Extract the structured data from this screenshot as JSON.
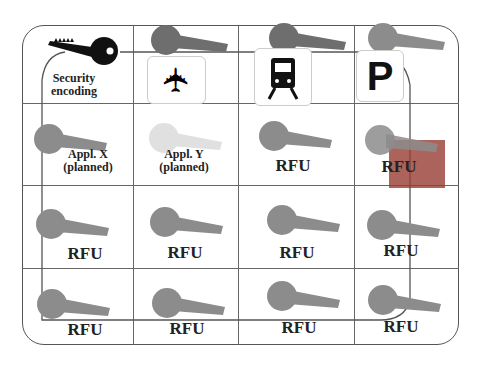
{
  "diagram": {
    "title_cell": {
      "label_line1": "Security",
      "label_line2": "encoding",
      "key_color": "#111111"
    },
    "icons": [
      {
        "name": "airplane-icon",
        "glyph": "✈"
      },
      {
        "name": "train-icon",
        "glyph": "🚆"
      },
      {
        "name": "parking-icon",
        "glyph": "P"
      }
    ],
    "cells": [
      {
        "line1": "Appl. X",
        "line2": "(planned)"
      },
      {
        "line1": "Appl. Y",
        "line2": "(planned)"
      },
      {
        "label": "RFU"
      },
      {
        "label": "RFU"
      },
      {
        "label": "RFU"
      },
      {
        "label": "RFU"
      },
      {
        "label": "RFU"
      },
      {
        "label": "RFU"
      },
      {
        "label": "RFU"
      },
      {
        "label": "RFU"
      },
      {
        "label": "RFU"
      },
      {
        "label": "RFU"
      }
    ],
    "colors": {
      "key_dark": "#6e6e6e",
      "key_mid": "#8c8c8c",
      "key_light": "#e0e0e0",
      "highlight": "#96403a",
      "grid": "#555555"
    }
  }
}
